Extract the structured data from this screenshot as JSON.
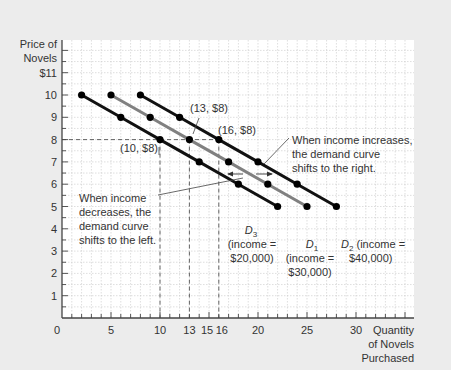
{
  "chart_data": {
    "type": "line",
    "title": "",
    "ylabel": "Price of Novels",
    "ylabel_lines": [
      "Price of",
      "Novels"
    ],
    "xlabel": "Quantity of Novels Purchased",
    "xlabel_lines": [
      "Quantity",
      "of Novels",
      "Purchased"
    ],
    "xlim": [
      0,
      36
    ],
    "ylim": [
      0,
      12.5
    ],
    "x_tick_labels": [
      {
        "value": 0,
        "label": "0"
      },
      {
        "value": 5,
        "label": "5"
      },
      {
        "value": 10,
        "label": "10"
      },
      {
        "value": 13,
        "label": "13"
      },
      {
        "value": 15,
        "label": "15"
      },
      {
        "value": 16,
        "label": "16"
      },
      {
        "value": 20,
        "label": "20"
      },
      {
        "value": 25,
        "label": "25"
      },
      {
        "value": 30,
        "label": "30"
      }
    ],
    "y_tick_labels": [
      {
        "value": 1,
        "label": "1"
      },
      {
        "value": 2,
        "label": "2"
      },
      {
        "value": 3,
        "label": "3"
      },
      {
        "value": 4,
        "label": "4"
      },
      {
        "value": 5,
        "label": "5"
      },
      {
        "value": 6,
        "label": "6"
      },
      {
        "value": 7,
        "label": "7"
      },
      {
        "value": 8,
        "label": "8"
      },
      {
        "value": 9,
        "label": "9"
      },
      {
        "value": 10,
        "label": "10"
      },
      {
        "value": 11,
        "label": "$11"
      }
    ],
    "grid": true,
    "legend": "none (inline labels)",
    "series": [
      {
        "name": "D3",
        "sub": "3",
        "label_lines": [
          "(income =",
          "$20,000)"
        ],
        "color": "#111111",
        "x": [
          2,
          6,
          10,
          14,
          18,
          22
        ],
        "y": [
          10,
          9,
          8,
          7,
          6,
          5
        ]
      },
      {
        "name": "D1",
        "sub": "1",
        "label_lines": [
          "(income =",
          "$30,000)"
        ],
        "color": "#808080",
        "x": [
          5,
          9,
          13,
          17,
          21,
          25
        ],
        "y": [
          10,
          9,
          8,
          7,
          6,
          5
        ]
      },
      {
        "name": "D2",
        "sub": "2",
        "label_lines": [
          "(income =",
          "$40,000)"
        ],
        "color": "#111111",
        "x": [
          8,
          12,
          16,
          20,
          24,
          28
        ],
        "y": [
          10,
          9,
          8,
          7,
          6,
          5
        ]
      }
    ],
    "reference_points": [
      {
        "label": "(10, $8)",
        "x": 10,
        "y": 8
      },
      {
        "label": "(13, $8)",
        "x": 13,
        "y": 8
      },
      {
        "label": "(16, $8)",
        "x": 16,
        "y": 8
      }
    ],
    "annotations": [
      {
        "id": "increase",
        "lines": [
          "When income increases,",
          "the demand curve",
          "shifts to the right."
        ]
      },
      {
        "id": "decrease",
        "lines": [
          "When income",
          "decreases, the",
          "demand curve",
          "shifts to the left."
        ]
      }
    ]
  },
  "colors": {
    "panel": "#ececec",
    "plot_bg": "#ffffff",
    "grid": "#c8c8c8",
    "axis": "#444444",
    "black_curve": "#111111",
    "gray_curve": "#808080"
  }
}
